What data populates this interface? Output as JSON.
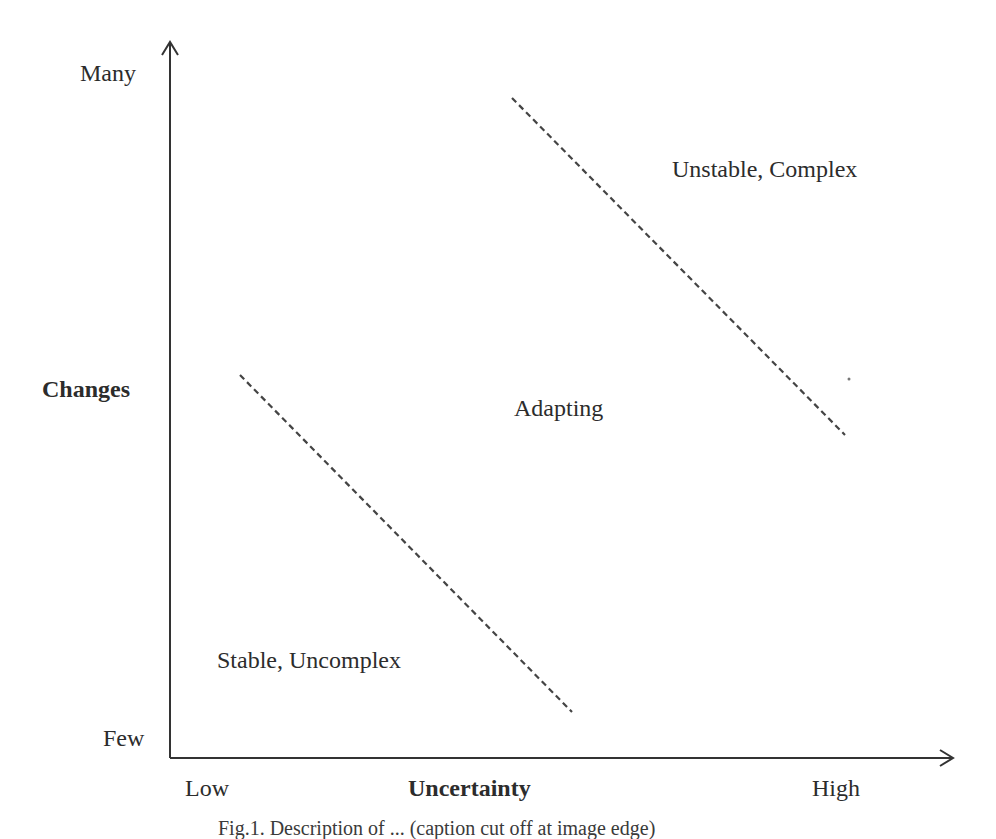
{
  "diagram": {
    "y_axis": {
      "title": "Changes",
      "high_label": "Many",
      "low_label": "Few"
    },
    "x_axis": {
      "title": "Uncertainty",
      "low_label": "Low",
      "high_label": "High"
    },
    "regions": [
      {
        "label": "Stable, Uncomplex"
      },
      {
        "label": "Adapting"
      },
      {
        "label": "Unstable, Complex"
      }
    ],
    "boundaries": [
      {
        "name": "lower-boundary",
        "style": "dashed",
        "from": [
          240,
          375
        ],
        "to": [
          572,
          712
        ]
      },
      {
        "name": "upper-boundary",
        "style": "dashed",
        "from": [
          512,
          98
        ],
        "to": [
          845,
          435
        ]
      }
    ],
    "colors": {
      "ink": "#2c2c2c",
      "background": "#ffffff"
    }
  },
  "caption": {
    "text": "Fig.1. Description of ... (caption cut off at image edge)"
  }
}
